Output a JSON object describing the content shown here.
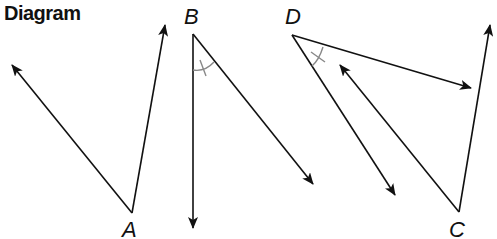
{
  "title": "Diagram",
  "colors": {
    "line": "#111111",
    "angle_mark": "#888888",
    "background": "#ffffff"
  },
  "angles": [
    {
      "vertex_label": "A",
      "vertex": [
        132,
        213
      ],
      "rays": [
        [
          12,
          65
        ],
        [
          165,
          25
        ]
      ],
      "congruence_mark": false
    },
    {
      "vertex_label": "B",
      "vertex": [
        193,
        34
      ],
      "rays": [
        [
          193,
          228
        ],
        [
          313,
          184
        ]
      ],
      "congruence_mark": true
    },
    {
      "vertex_label": "D",
      "vertex": [
        292,
        35
      ],
      "rays": [
        [
          471,
          88
        ],
        [
          395,
          195
        ]
      ],
      "congruence_mark": true
    },
    {
      "vertex_label": "C",
      "vertex": [
        459,
        212
      ],
      "rays": [
        [
          340,
          65
        ],
        [
          490,
          25
        ]
      ],
      "congruence_mark": false
    }
  ]
}
